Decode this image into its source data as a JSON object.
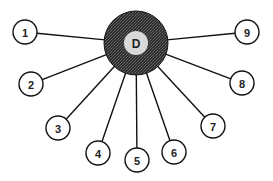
{
  "diagram": {
    "type": "star-topology",
    "hub": {
      "label": "D",
      "cx": 136,
      "cy": 43,
      "outer_r": 32,
      "inner_r": 12,
      "outer_fill": "#3a3a3a",
      "inner_fill": "#d9d9d9"
    },
    "nodes": [
      {
        "label": "1",
        "cx": 25,
        "cy": 32
      },
      {
        "label": "2",
        "cx": 31,
        "cy": 84
      },
      {
        "label": "3",
        "cx": 58,
        "cy": 128
      },
      {
        "label": "4",
        "cx": 98,
        "cy": 153
      },
      {
        "label": "5",
        "cx": 137,
        "cy": 160
      },
      {
        "label": "6",
        "cx": 174,
        "cy": 152
      },
      {
        "label": "7",
        "cx": 213,
        "cy": 126
      },
      {
        "label": "8",
        "cx": 242,
        "cy": 83
      },
      {
        "label": "9",
        "cx": 247,
        "cy": 32
      }
    ],
    "node_r": 12,
    "stroke": "#111111",
    "edges": [
      {
        "from": "D",
        "to": "1"
      },
      {
        "from": "D",
        "to": "2"
      },
      {
        "from": "D",
        "to": "3"
      },
      {
        "from": "D",
        "to": "4"
      },
      {
        "from": "D",
        "to": "5"
      },
      {
        "from": "D",
        "to": "6"
      },
      {
        "from": "D",
        "to": "7"
      },
      {
        "from": "D",
        "to": "8"
      },
      {
        "from": "D",
        "to": "9"
      }
    ]
  }
}
